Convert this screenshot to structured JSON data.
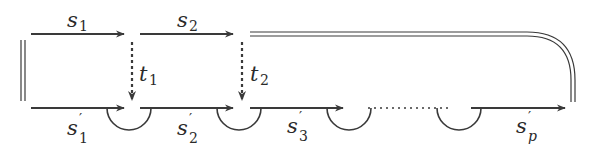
{
  "diagram": {
    "colors": {
      "stroke": "#3a3a3a",
      "background": "#ffffff"
    },
    "top_row": [
      {
        "id": "s1",
        "base": "s",
        "sub": "1",
        "prime": false,
        "x1": 31,
        "x2": 124,
        "y": 34
      },
      {
        "id": "s2",
        "base": "s",
        "sub": "2",
        "prime": false,
        "x1": 140,
        "x2": 233,
        "y": 34
      }
    ],
    "top_double_line": {
      "x1": 250,
      "x2": 527,
      "y": 34,
      "corner_to_x": 573,
      "end_y": 102
    },
    "left_double_line": {
      "x": 23,
      "y1": 40,
      "y2": 100
    },
    "vertical_dotted_arrows": [
      {
        "id": "t1",
        "base": "t",
        "sub": "1",
        "x": 132,
        "y1": 42,
        "y2": 100
      },
      {
        "id": "t2",
        "base": "t",
        "sub": "2",
        "x": 242,
        "y1": 42,
        "y2": 100
      }
    ],
    "bottom_row": [
      {
        "id": "s1p",
        "base": "s",
        "sub": "1",
        "prime": true,
        "x1": 31,
        "x2": 124,
        "y": 108
      },
      {
        "id": "s2p",
        "base": "s",
        "sub": "2",
        "prime": true,
        "x1": 140,
        "x2": 233,
        "y": 108
      },
      {
        "id": "s3p",
        "base": "s",
        "sub": "3",
        "prime": true,
        "x1": 250,
        "x2": 343,
        "y": 108
      },
      {
        "id": "spp",
        "base": "s",
        "sub": "p",
        "prime": true,
        "x1": 471,
        "x2": 565,
        "y": 108
      }
    ],
    "bottom_dotted_gap": {
      "x1": 368,
      "x2": 450,
      "y": 108
    },
    "semicircles": [
      {
        "cx": 129,
        "r": 22
      },
      {
        "cx": 239,
        "r": 22
      },
      {
        "cx": 349,
        "r": 22
      },
      {
        "cx": 459,
        "r": 22
      }
    ],
    "labels": {
      "s1": {
        "base": "s",
        "sub": "1",
        "prime": ""
      },
      "s2": {
        "base": "s",
        "sub": "2",
        "prime": ""
      },
      "t1": {
        "base": "t",
        "sub": "1"
      },
      "t2": {
        "base": "t",
        "sub": "2"
      },
      "s1p": {
        "base": "s",
        "sub": "1",
        "prime": "′"
      },
      "s2p": {
        "base": "s",
        "sub": "2",
        "prime": "′"
      },
      "s3p": {
        "base": "s",
        "sub": "3",
        "prime": "′"
      },
      "spp": {
        "base": "s",
        "sub": "p",
        "prime": "′"
      }
    }
  }
}
